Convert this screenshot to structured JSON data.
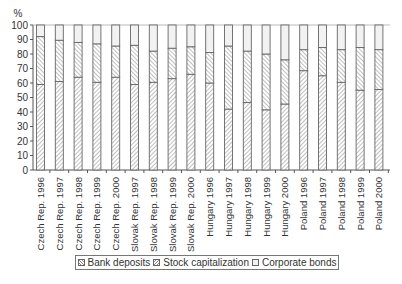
{
  "chart_data": {
    "type": "bar",
    "stacked": true,
    "title": "",
    "xlabel": "",
    "ylabel": "%",
    "ylim": [
      0,
      100
    ],
    "yticks": [
      0,
      10,
      20,
      30,
      40,
      50,
      60,
      70,
      80,
      90,
      100
    ],
    "grid": false,
    "legend_position": "bottom",
    "categories": [
      "Czech Rep. 1996",
      "Czech Rep. 1997",
      "Czech Rep. 1998",
      "Czech Rep. 1999",
      "Czech Rep. 2000",
      "Slovak Rep. 1997",
      "Slovak Rep. 1998",
      "Slovak Rep. 1999",
      "Slovak Rep. 2000",
      "Hungary 1996",
      "Hungary 1997",
      "Hungary 1998",
      "Hungary 1999",
      "Hungary 2000",
      "Poland 1996",
      "Poland 1997",
      "Poland 1998",
      "Poland 1999",
      "Poland 2000"
    ],
    "series": [
      {
        "name": "Bank deposits",
        "pattern": "hatch-down",
        "values": [
          59,
          61,
          64,
          60.5,
          64,
          59,
          60.5,
          63,
          66,
          60,
          42,
          46.5,
          41.5,
          45.5,
          68.5,
          65,
          60.5,
          55,
          55.5
        ]
      },
      {
        "name": "Stock capitalization",
        "pattern": "hatch-up",
        "values": [
          33,
          28.5,
          24,
          26.5,
          21.5,
          27,
          21.5,
          21,
          19,
          21,
          43.5,
          35.5,
          38.5,
          30.5,
          14.5,
          19.5,
          22.5,
          29.5,
          27.5
        ]
      },
      {
        "name": "Corporate bonds",
        "pattern": "light-fill",
        "values": [
          8,
          10.5,
          12,
          13,
          14.5,
          14,
          18,
          16,
          15,
          19,
          14.5,
          18,
          20,
          24,
          17,
          15.5,
          17,
          15.5,
          17
        ]
      }
    ]
  },
  "legend": {
    "items": [
      {
        "label": "Bank deposits"
      },
      {
        "label": "Stock capitalization"
      },
      {
        "label": "Corporate bonds"
      }
    ]
  },
  "colors": {
    "axis": "#555555",
    "bar_outline": "#666666",
    "hatch": "#888888",
    "bonds_fill": "#f2f2f2"
  }
}
